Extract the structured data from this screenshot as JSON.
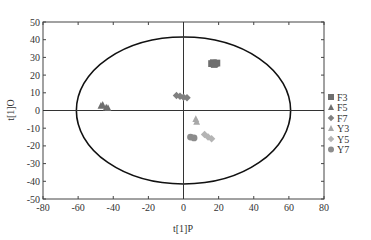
{
  "chart_data": {
    "type": "scatter",
    "title": "",
    "xlabel": "t[1]P",
    "ylabel": "t[1]O",
    "xlim": [
      -80,
      80
    ],
    "ylim": [
      -50,
      50
    ],
    "xticks": [
      -80,
      -60,
      -40,
      -20,
      0,
      20,
      40,
      60,
      80
    ],
    "yticks": [
      -50,
      -40,
      -30,
      -20,
      -10,
      0,
      10,
      20,
      30,
      40,
      50
    ],
    "grid": false,
    "legend_position": "right",
    "ellipse": {
      "cx": 0,
      "cy": 0,
      "rx": 61,
      "ry": 41.5
    },
    "series": [
      {
        "name": "F3",
        "marker": "square",
        "color": "#6e6e6e",
        "points": [
          [
            16,
            26.5
          ],
          [
            17,
            27
          ],
          [
            18,
            26.5
          ],
          [
            19,
            26.8
          ],
          [
            17.5,
            26
          ]
        ]
      },
      {
        "name": "F5",
        "marker": "triangle",
        "color": "#6e6e6e",
        "points": [
          [
            -47,
            2.5
          ],
          [
            -46,
            3
          ],
          [
            -44,
            1.5
          ],
          [
            -43,
            1.2
          ]
        ]
      },
      {
        "name": "F7",
        "marker": "diamond",
        "color": "#808080",
        "points": [
          [
            -4,
            8.5
          ],
          [
            -2,
            8
          ],
          [
            0,
            7.5
          ],
          [
            2,
            7.2
          ]
        ]
      },
      {
        "name": "Y3",
        "marker": "triangle",
        "color": "#a8a8a8",
        "points": [
          [
            7,
            -5
          ],
          [
            7.5,
            -6.5
          ]
        ]
      },
      {
        "name": "Y5",
        "marker": "diamond",
        "color": "#b4b4b4",
        "points": [
          [
            12,
            -13.5
          ],
          [
            14,
            -15
          ],
          [
            16,
            -16
          ]
        ]
      },
      {
        "name": "Y7",
        "marker": "circle",
        "color": "#8c8c8c",
        "points": [
          [
            4,
            -15
          ],
          [
            6,
            -15.5
          ]
        ]
      }
    ]
  },
  "axes": {
    "xlabel": "t[1]P",
    "ylabel": "t[1]O",
    "x_tick_labels": [
      "-80",
      "-60",
      "-40",
      "-20",
      "0",
      "20",
      "40",
      "60",
      "80"
    ],
    "y_tick_labels": [
      "50",
      "40",
      "30",
      "20",
      "10",
      "0",
      "-10",
      "-20",
      "-30",
      "-40",
      "-50"
    ]
  },
  "legend": {
    "items": [
      {
        "label": "F3",
        "marker": "square"
      },
      {
        "label": "F5",
        "marker": "triangle"
      },
      {
        "label": "F7",
        "marker": "diamond"
      },
      {
        "label": "Y3",
        "marker": "triangle"
      },
      {
        "label": "Y5",
        "marker": "diamond"
      },
      {
        "label": "Y7",
        "marker": "circle"
      }
    ]
  }
}
